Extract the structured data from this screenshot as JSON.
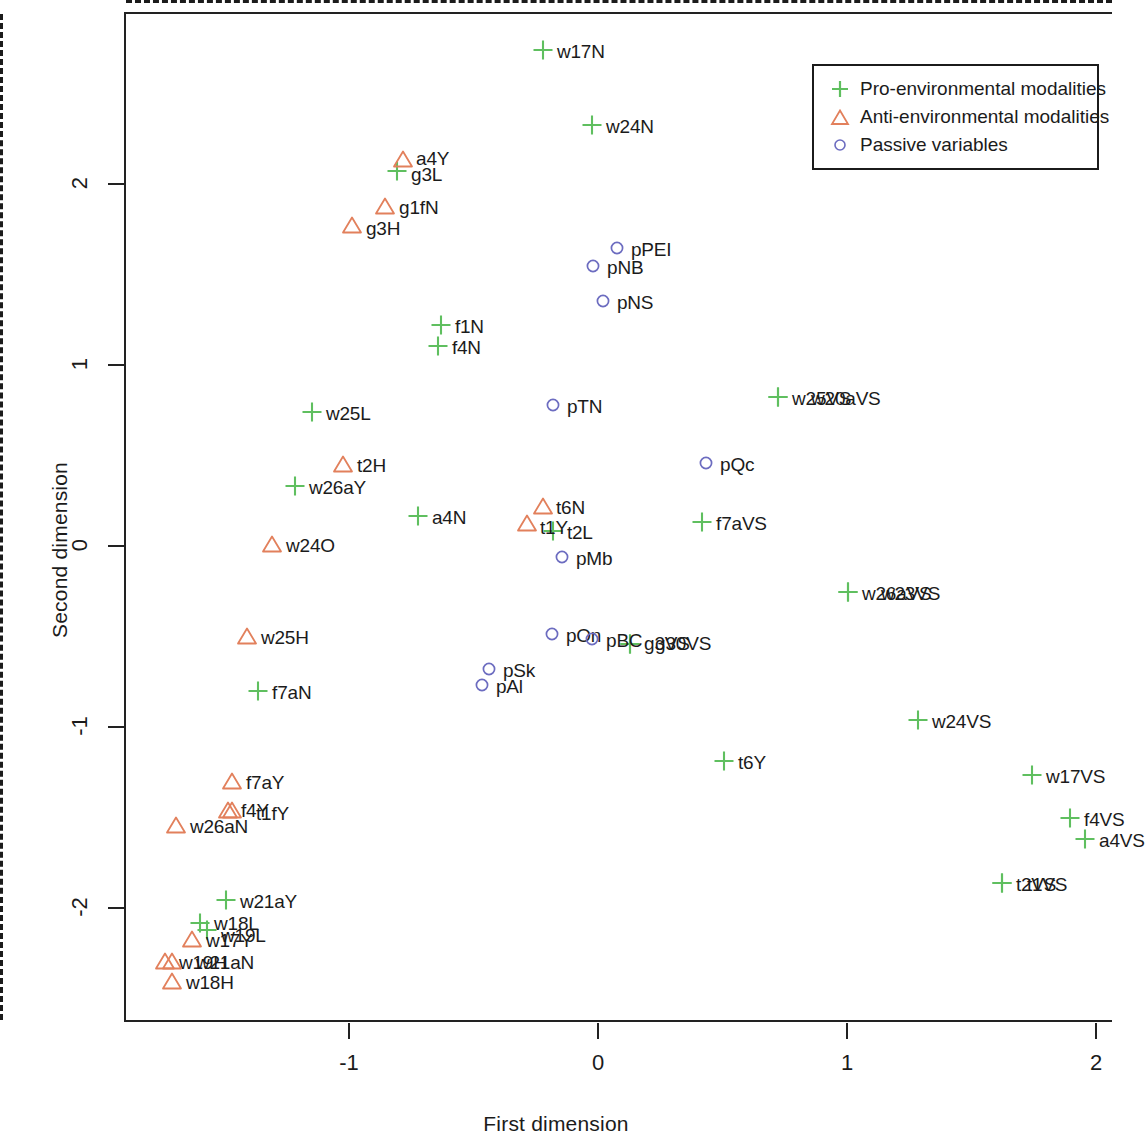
{
  "chart_data": {
    "type": "scatter",
    "title": "",
    "xlabel": "First dimension",
    "ylabel": "Second dimension",
    "xlim": [
      -1.9,
      2.07
    ],
    "ylim": [
      -2.26,
      2.78
    ],
    "xticks": [
      -1,
      0,
      1,
      2
    ],
    "xtick_labels": [
      "-1",
      "0",
      "1",
      "2"
    ],
    "yticks": [
      -2,
      -1,
      0,
      1,
      2
    ],
    "ytick_labels": [
      "-2",
      "-1",
      "0",
      "1",
      "2"
    ],
    "grid": false,
    "reference_lines": {
      "x": 0,
      "y": 0,
      "style": "dashed"
    },
    "legend": {
      "position": "top-right",
      "entries": [
        {
          "marker": "plus",
          "color": "#5FBF5F",
          "label": "Pro-environmental modalities"
        },
        {
          "marker": "triangle",
          "color": "#E2805C",
          "label": "Anti-environmental modalities"
        },
        {
          "marker": "circle",
          "color": "#6C6CC0",
          "label": "Passive variables"
        }
      ]
    },
    "series": [
      {
        "name": "Pro-environmental modalities",
        "marker": "plus",
        "color": "#5FBF5F",
        "points": [
          {
            "label": "w17N",
            "x": -0.221,
            "y": 2.729,
            "lx": 14,
            "ly": 0
          },
          {
            "label": "w24N",
            "x": -0.024,
            "y": 2.315,
            "lx": 14,
            "ly": 0
          },
          {
            "label": "g3L",
            "x": -0.807,
            "y": 2.061,
            "lx": 14,
            "ly": 2
          },
          {
            "label": "f1N",
            "x": -0.631,
            "y": 1.21,
            "lx": 14,
            "ly": 0
          },
          {
            "label": "f4N",
            "x": -0.643,
            "y": 1.094,
            "lx": 14,
            "ly": 0
          },
          {
            "label": "w25VS",
            "x": 0.723,
            "y": 0.812,
            "lx": 14,
            "ly": 0
          },
          {
            "label": "w20aVS",
            "x": 0.723,
            "y": 0.812,
            "lx": 33,
            "ly": 0
          },
          {
            "label": "w25L",
            "x": -1.149,
            "y": 0.729,
            "lx": 14,
            "ly": 0
          },
          {
            "label": "w26aY",
            "x": -1.217,
            "y": 0.32,
            "lx": 14,
            "ly": 0
          },
          {
            "label": "a4N",
            "x": -0.723,
            "y": 0.155,
            "lx": 14,
            "ly": 0
          },
          {
            "label": "f7aVS",
            "x": 0.418,
            "y": 0.122,
            "lx": 14,
            "ly": 0
          },
          {
            "label": "t2L",
            "x": -0.181,
            "y": 0.072,
            "lx": 14,
            "ly": 0
          },
          {
            "label": "w26aVS",
            "x": 1.004,
            "y": -0.265,
            "lx": 14,
            "ly": 0
          },
          {
            "label": "w23VS",
            "x": 1.004,
            "y": -0.265,
            "lx": 33,
            "ly": 0
          },
          {
            "label": "g3VS",
            "x": 0.129,
            "y": -0.552,
            "lx": 14,
            "ly": -2
          },
          {
            "label": "g30VS",
            "x": 0.129,
            "y": -0.552,
            "lx": 25,
            "ly": -2
          },
          {
            "label": "f7aN",
            "x": -1.365,
            "y": -0.812,
            "lx": 14,
            "ly": 0
          },
          {
            "label": "w24VS",
            "x": 1.285,
            "y": -0.972,
            "lx": 14,
            "ly": 0
          },
          {
            "label": "t6Y",
            "x": 0.506,
            "y": -1.199,
            "lx": 14,
            "ly": 0
          },
          {
            "label": "w17VS",
            "x": 1.743,
            "y": -1.276,
            "lx": 14,
            "ly": 0
          },
          {
            "label": "f4VS",
            "x": 1.896,
            "y": -1.514,
            "lx": 14,
            "ly": 0
          },
          {
            "label": "a4VS",
            "x": 1.956,
            "y": -1.63,
            "lx": 14,
            "ly": 0
          },
          {
            "label": "t2VS",
            "x": 1.622,
            "y": -1.873,
            "lx": 14,
            "ly": 0
          },
          {
            "label": "t1VS",
            "x": 1.622,
            "y": -1.873,
            "lx": 25,
            "ly": 0
          },
          {
            "label": "w21aY",
            "x": -1.494,
            "y": -1.967,
            "lx": 14,
            "ly": 0
          },
          {
            "label": "w18L",
            "x": -1.598,
            "y": -2.094,
            "lx": 14,
            "ly": -1
          },
          {
            "label": "w19L",
            "x": -1.57,
            "y": -2.133,
            "lx": 14,
            "ly": 4
          }
        ]
      },
      {
        "name": "Anti-environmental modalities",
        "marker": "triangle",
        "color": "#E2805C",
        "points": [
          {
            "label": "a4Y",
            "x": -0.783,
            "y": 2.127,
            "lx": 13,
            "ly": -2
          },
          {
            "label": "g1fN",
            "x": -0.855,
            "y": 1.867,
            "lx": 14,
            "ly": 0
          },
          {
            "label": "g3H",
            "x": -0.988,
            "y": 1.762,
            "lx": 14,
            "ly": 2
          },
          {
            "label": "t2H",
            "x": -1.024,
            "y": 0.442,
            "lx": 14,
            "ly": 0
          },
          {
            "label": "t6N",
            "x": -0.221,
            "y": 0.21,
            "lx": 13,
            "ly": 0
          },
          {
            "label": "t1Y",
            "x": -0.285,
            "y": 0.116,
            "lx": 13,
            "ly": 3
          },
          {
            "label": "w24O",
            "x": -1.309,
            "y": 0.0,
            "lx": 14,
            "ly": 0
          },
          {
            "label": "w25H",
            "x": -1.41,
            "y": -0.508,
            "lx": 14,
            "ly": 0
          },
          {
            "label": "f7aY",
            "x": -1.47,
            "y": -1.309,
            "lx": 14,
            "ly": 0
          },
          {
            "label": "f4Y",
            "x": -1.486,
            "y": -1.47,
            "lx": 13,
            "ly": -1
          },
          {
            "label": "t1fY",
            "x": -1.47,
            "y": -1.47,
            "lx": 24,
            "ly": 2
          },
          {
            "label": "w26aN",
            "x": -1.695,
            "y": -1.552,
            "lx": 14,
            "ly": 0
          },
          {
            "label": "w17Y",
            "x": -1.631,
            "y": -2.182,
            "lx": 14,
            "ly": 0
          },
          {
            "label": "w19H",
            "x": -1.739,
            "y": -2.304,
            "lx": 14,
            "ly": 0
          },
          {
            "label": "w21aN",
            "x": -1.711,
            "y": -2.304,
            "lx": 24,
            "ly": 0
          },
          {
            "label": "w18H",
            "x": -1.711,
            "y": -2.414,
            "lx": 14,
            "ly": 0
          }
        ]
      },
      {
        "name": "Passive variables",
        "marker": "circle",
        "color": "#6C6CC0",
        "points": [
          {
            "label": "pPEI",
            "x": 0.076,
            "y": 1.635,
            "lx": 14,
            "ly": 0
          },
          {
            "label": "pNB",
            "x": -0.02,
            "y": 1.536,
            "lx": 14,
            "ly": 0
          },
          {
            "label": "pNS",
            "x": 0.02,
            "y": 1.343,
            "lx": 14,
            "ly": 0
          },
          {
            "label": "pTN",
            "x": -0.181,
            "y": 0.768,
            "lx": 14,
            "ly": 0
          },
          {
            "label": "pQc",
            "x": 0.434,
            "y": 0.448,
            "lx": 14,
            "ly": 0
          },
          {
            "label": "pMb",
            "x": -0.145,
            "y": -0.072,
            "lx": 14,
            "ly": 0
          },
          {
            "label": "pOn",
            "x": -0.185,
            "y": -0.497,
            "lx": 14,
            "ly": 0
          },
          {
            "label": "pBC",
            "x": -0.024,
            "y": -0.525,
            "lx": 14,
            "ly": 0
          },
          {
            "label": "pSk",
            "x": -0.438,
            "y": -0.691,
            "lx": 14,
            "ly": 0
          },
          {
            "label": "pAl",
            "x": -0.466,
            "y": -0.779,
            "lx": 14,
            "ly": 0
          }
        ]
      }
    ]
  }
}
